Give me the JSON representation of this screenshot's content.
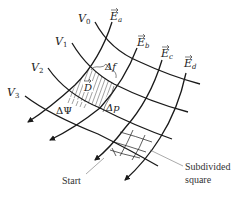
{
  "diagram": {
    "type": "curvilinear-square field map",
    "equipotentials": [
      {
        "id": "V0",
        "label": "V",
        "sub": "0"
      },
      {
        "id": "V1",
        "label": "V",
        "sub": "1"
      },
      {
        "id": "V2",
        "label": "V",
        "sub": "2"
      },
      {
        "id": "V3",
        "label": "V",
        "sub": "3"
      }
    ],
    "field_lines": [
      {
        "id": "Ea",
        "label": "E",
        "sub": "a"
      },
      {
        "id": "Eb",
        "label": "E",
        "sub": "b"
      },
      {
        "id": "Ec",
        "label": "E",
        "sub": "c"
      },
      {
        "id": "Ed",
        "label": "E",
        "sub": "d"
      }
    ],
    "annotations": {
      "delta_f": "Δf",
      "d_vector": "D",
      "delta_p": "Δp",
      "delta_psi": "ΔΨ",
      "start": "Start",
      "subdivided_line1": "Subdivided",
      "subdivided_line2": "square"
    },
    "colors": {
      "line": "#1a1a1a",
      "text": "#222222",
      "background": "#ffffff"
    }
  }
}
